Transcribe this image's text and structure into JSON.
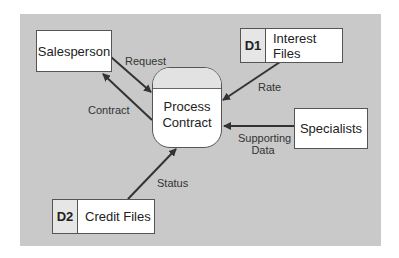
{
  "diagram": {
    "type": "data-flow-diagram",
    "process": {
      "label_line1": "Process",
      "label_line2": "Contract"
    },
    "external_entities": [
      {
        "label": "Salesperson"
      },
      {
        "label": "Specialists"
      }
    ],
    "data_stores": [
      {
        "id": "D1",
        "label": "Interest Files"
      },
      {
        "id": "D2",
        "label": "Credit Files"
      }
    ],
    "flows": [
      {
        "label": "Request",
        "from": "Salesperson",
        "to": "Process Contract"
      },
      {
        "label": "Contract",
        "from": "Process Contract",
        "to": "Salesperson"
      },
      {
        "label": "Rate",
        "from": "Interest Files",
        "to": "Process Contract"
      },
      {
        "label_line1": "Supporting",
        "label_line2": "Data",
        "from": "Specialists",
        "to": "Process Contract"
      },
      {
        "label": "Status",
        "from": "Credit Files",
        "to": "Process Contract"
      }
    ],
    "colors": {
      "panel": "#c9c9c9",
      "box": "#ffffff",
      "line": "#333333",
      "store_id_cell": "#e6e6e6"
    }
  }
}
